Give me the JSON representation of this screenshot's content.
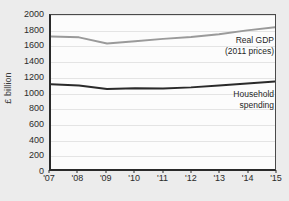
{
  "chart_data": {
    "type": "line",
    "title": "",
    "subtitle": "",
    "xlabel": "",
    "ylabel": "£ billion",
    "x": [
      "'07",
      "'08",
      "'09",
      "'10",
      "'11",
      "'12",
      "'13",
      "'14",
      "'15"
    ],
    "categories": [
      "'07",
      "'08",
      "'09",
      "'10",
      "'11",
      "'12",
      "'13",
      "'14",
      "'15"
    ],
    "xlim": [
      2007,
      2015
    ],
    "ylim": [
      0,
      2000
    ],
    "y_ticks": [
      2000,
      1800,
      1600,
      1400,
      1200,
      1000,
      800,
      600,
      400,
      200,
      0
    ],
    "grid": true,
    "legend_position": "inline-right",
    "series": [
      {
        "name": "Real GDP (2011 prices)",
        "label_lines": [
          "Real GDP",
          "(2011 prices)"
        ],
        "color": "#9a9a9a",
        "line_width": 2,
        "values": [
          1720,
          1710,
          1630,
          1660,
          1690,
          1715,
          1750,
          1800,
          1840
        ]
      },
      {
        "name": "Household spending",
        "label_lines": [
          "Household",
          "spending"
        ],
        "color": "#2a2a2a",
        "line_width": 2,
        "values": [
          1100,
          1085,
          1040,
          1048,
          1045,
          1060,
          1085,
          1110,
          1135
        ]
      }
    ]
  },
  "figure": {
    "background_color": "#ececec",
    "plot_background_color": "#fcfcfc",
    "axis_color": "#2a2a2a",
    "gridline_color": "#e4e4e4"
  }
}
